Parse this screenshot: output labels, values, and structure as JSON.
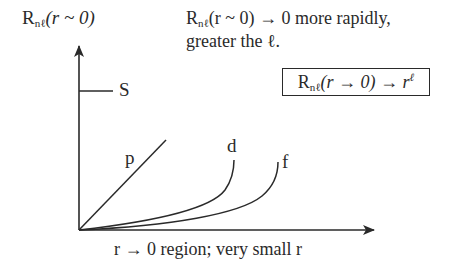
{
  "diagram": {
    "y_axis_label": {
      "symbol": "R",
      "subscript": "nℓ",
      "argument": "(r ~ 0)"
    },
    "note": {
      "line1_symbol": "R",
      "line1_subscript": "nℓ",
      "line1_rest": "(r ~ 0) → 0 more rapidly,",
      "line2": "greater the ℓ."
    },
    "boxed_formula": {
      "symbol": "R",
      "subscript": "nℓ",
      "argument": "(r → 0) → r",
      "superscript": "ℓ"
    },
    "x_axis_label": "r → 0 region; very small r",
    "curve_labels": {
      "s": "S",
      "p": "p",
      "d": "d",
      "f": "f"
    },
    "stroke_color": "#2a2a2a",
    "background_color": "#ffffff"
  }
}
